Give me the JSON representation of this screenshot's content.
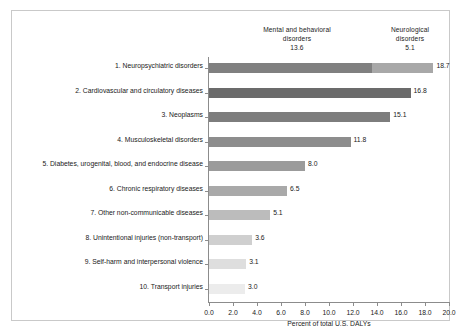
{
  "chart_data": {
    "type": "bar",
    "orientation": "horizontal",
    "title": "",
    "xlabel": "Percent of total U.S. DALYs",
    "ylabel": "",
    "xlim": [
      0.0,
      20.0
    ],
    "xticks": [
      "0.0",
      "2.0",
      "4.0",
      "6.0",
      "8.0",
      "10.0",
      "12.0",
      "14.0",
      "16.0",
      "18.0",
      "20.0"
    ],
    "grid": false,
    "legend": "none",
    "categories": [
      "1. Neuropsychiatric disorders",
      "2. Cardiovascular and circulatory diseases",
      "3. Neoplasms",
      "4. Musculoskeletal disorders",
      "5. Diabetes, urogenital, blood, and endocrine disease",
      "6. Chronic respiratory diseases",
      "7. Other non-communicable diseases",
      "8. Unintentional injuries (non-transport)",
      "9. Self-harm and interpersonal violence",
      "10. Transport injuries"
    ],
    "values": [
      18.7,
      16.8,
      15.1,
      11.8,
      8.0,
      6.5,
      5.1,
      3.6,
      3.1,
      3.0
    ],
    "value_labels": [
      "18.7",
      "16.8",
      "15.1",
      "11.8",
      "8.0",
      "6.5",
      "5.1",
      "3.6",
      "3.1",
      "3.0"
    ],
    "bars": [
      {
        "label": "1. Neuropsychiatric disorders",
        "value": 18.7,
        "value_label": "18.7",
        "segments": [
          {
            "name": "Mental and behavioral disorders",
            "value": 13.6,
            "color": "#808080"
          },
          {
            "name": "Neurological disorders",
            "value": 5.1,
            "color": "#a8a8a8"
          }
        ]
      },
      {
        "label": "2. Cardiovascular and circulatory diseases",
        "value": 16.8,
        "value_label": "16.8",
        "segments": [
          {
            "name": "bar",
            "value": 16.8,
            "color": "#6b6b6b"
          }
        ]
      },
      {
        "label": "3. Neoplasms",
        "value": 15.1,
        "value_label": "15.1",
        "segments": [
          {
            "name": "bar",
            "value": 15.1,
            "color": "#7d7d7d"
          }
        ]
      },
      {
        "label": "4. Musculoskeletal disorders",
        "value": 11.8,
        "value_label": "11.8",
        "segments": [
          {
            "name": "bar",
            "value": 11.8,
            "color": "#8d8d8d"
          }
        ]
      },
      {
        "label": "5. Diabetes, urogenital, blood, and endocrine disease",
        "value": 8.0,
        "value_label": "8.0",
        "segments": [
          {
            "name": "bar",
            "value": 8.0,
            "color": "#9b9b9b"
          }
        ]
      },
      {
        "label": "6. Chronic respiratory diseases",
        "value": 6.5,
        "value_label": "6.5",
        "segments": [
          {
            "name": "bar",
            "value": 6.5,
            "color": "#a9a9a9"
          }
        ]
      },
      {
        "label": "7. Other non-communicable diseases",
        "value": 5.1,
        "value_label": "5.1",
        "segments": [
          {
            "name": "bar",
            "value": 5.1,
            "color": "#bcbcbc"
          }
        ]
      },
      {
        "label": "8. Unintentional injuries (non-transport)",
        "value": 3.6,
        "value_label": "3.6",
        "segments": [
          {
            "name": "bar",
            "value": 3.6,
            "color": "#cfcfcf"
          }
        ]
      },
      {
        "label": "9. Self-harm and interpersonal violence",
        "value": 3.1,
        "value_label": "3.1",
        "segments": [
          {
            "name": "bar",
            "value": 3.1,
            "color": "#dedede"
          }
        ]
      },
      {
        "label": "10. Transport injuries",
        "value": 3.0,
        "value_label": "3.0",
        "segments": [
          {
            "name": "bar",
            "value": 3.0,
            "color": "#ececec"
          }
        ]
      }
    ],
    "annotations": [
      {
        "name": "mental-and-behavioral",
        "line1": "Mental and behavioral",
        "line2": "disorders",
        "value": "13.6"
      },
      {
        "name": "neurological",
        "line1": "Neurological",
        "line2": "disorders",
        "value": "5.1"
      }
    ]
  },
  "colors": {
    "axis": "#8c8c8c",
    "frame": "#c9c9c9",
    "text": "#1a1a1a",
    "background": "#ffffff"
  }
}
